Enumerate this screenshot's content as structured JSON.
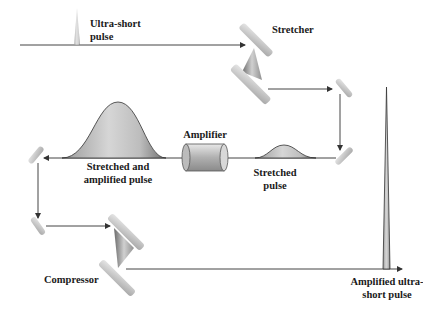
{
  "labels": {
    "ultra_short_1": "Ultra-short",
    "ultra_short_2": "pulse",
    "stretcher": "Stretcher",
    "amplifier": "Amplifier",
    "stretched_amp_1": "Stretched and",
    "stretched_amp_2": "amplified pulse",
    "stretched_1": "Stretched",
    "stretched_2": "pulse",
    "compressor": "Compressor",
    "amp_ultra_1": "Amplified ultra-",
    "amp_ultra_2": "short pulse"
  },
  "colors": {
    "line": "#333333",
    "pulse_fill": "#b8b8b8",
    "optic": "#c8c8c8",
    "text": "#1a1a1a"
  }
}
